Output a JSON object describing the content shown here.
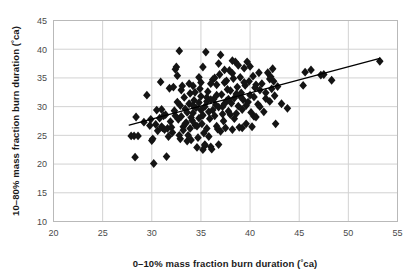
{
  "chart_data": {
    "type": "scatter",
    "title": "",
    "xlabel": "0–10% mass fraction burn duration (°ca)",
    "ylabel": "10–80% mass fraction burn duration (°ca)",
    "xlim": [
      20,
      55
    ],
    "ylim": [
      10,
      45
    ],
    "xticks": [
      20,
      25,
      30,
      35,
      40,
      45,
      50,
      55
    ],
    "yticks": [
      10,
      15,
      20,
      25,
      30,
      35,
      40,
      45
    ],
    "grid": true,
    "legend": null,
    "marker": {
      "shape": "diamond",
      "color": "#141414",
      "size": 4.4
    },
    "trendline": {
      "type": "linear",
      "color": "#000000",
      "width": 1.3,
      "x_start": 27.7,
      "y_start": 26.8,
      "x_end": 53.2,
      "y_end": 38.4
    },
    "points": [
      [
        27.9,
        24.9
      ],
      [
        28.2,
        24.9
      ],
      [
        28.4,
        28.2
      ],
      [
        28.6,
        24.9
      ],
      [
        28.3,
        21.2
      ],
      [
        29.2,
        27.3
      ],
      [
        29.5,
        32.0
      ],
      [
        29.8,
        26.7
      ],
      [
        30.0,
        24.1
      ],
      [
        30.1,
        24.4
      ],
      [
        30.2,
        20.1
      ],
      [
        30.4,
        26.9
      ],
      [
        30.6,
        25.8
      ],
      [
        30.9,
        34.3
      ],
      [
        31.0,
        26.5
      ],
      [
        31.1,
        26.3
      ],
      [
        31.3,
        26.0
      ],
      [
        31.4,
        28.6
      ],
      [
        31.5,
        21.3
      ],
      [
        31.6,
        26.2
      ],
      [
        31.8,
        33.2
      ],
      [
        31.9,
        27.4
      ],
      [
        32.0,
        26.4
      ],
      [
        32.1,
        25.5
      ],
      [
        32.2,
        33.4
      ],
      [
        32.3,
        29.3
      ],
      [
        32.4,
        36.5
      ],
      [
        32.5,
        36.9
      ],
      [
        32.6,
        35.4
      ],
      [
        32.7,
        27.8
      ],
      [
        32.8,
        39.7
      ],
      [
        32.9,
        30.2
      ],
      [
        33.0,
        28.3
      ],
      [
        33.1,
        33.6
      ],
      [
        33.2,
        26.5
      ],
      [
        33.3,
        31.6
      ],
      [
        33.4,
        29.6
      ],
      [
        33.5,
        27.2
      ],
      [
        33.6,
        24.0
      ],
      [
        33.7,
        25.0
      ],
      [
        33.8,
        30.5
      ],
      [
        33.9,
        32.3
      ],
      [
        34.0,
        28.1
      ],
      [
        34.1,
        27.6
      ],
      [
        34.2,
        28.9
      ],
      [
        34.3,
        31.1
      ],
      [
        34.4,
        26.8
      ],
      [
        34.5,
        29.8
      ],
      [
        34.6,
        22.9
      ],
      [
        34.7,
        24.6
      ],
      [
        34.8,
        30.7
      ],
      [
        34.9,
        33.1
      ],
      [
        35.0,
        29.4
      ],
      [
        35.0,
        31.8
      ],
      [
        35.1,
        27.0
      ],
      [
        35.2,
        28.5
      ],
      [
        35.3,
        25.4
      ],
      [
        35.4,
        23.4
      ],
      [
        35.5,
        39.5
      ],
      [
        35.6,
        30.9
      ],
      [
        35.7,
        32.6
      ],
      [
        35.8,
        29.1
      ],
      [
        35.9,
        27.9
      ],
      [
        36.0,
        23.0
      ],
      [
        36.1,
        22.6
      ],
      [
        36.2,
        34.7
      ],
      [
        36.3,
        31.3
      ],
      [
        36.4,
        28.4
      ],
      [
        36.5,
        30.3
      ],
      [
        36.6,
        33.8
      ],
      [
        36.7,
        26.1
      ],
      [
        36.8,
        29.9
      ],
      [
        36.9,
        35.6
      ],
      [
        37.0,
        39.0
      ],
      [
        37.1,
        32.1
      ],
      [
        37.2,
        30.0
      ],
      [
        37.3,
        27.5
      ],
      [
        37.4,
        34.2
      ],
      [
        37.5,
        26.3
      ],
      [
        37.6,
        31.0
      ],
      [
        37.7,
        33.0
      ],
      [
        37.8,
        29.2
      ],
      [
        37.9,
        36.3
      ],
      [
        38.0,
        32.8
      ],
      [
        38.1,
        30.6
      ],
      [
        38.2,
        26.0
      ],
      [
        38.3,
        34.9
      ],
      [
        38.4,
        31.5
      ],
      [
        38.5,
        37.8
      ],
      [
        38.6,
        28.8
      ],
      [
        38.7,
        33.4
      ],
      [
        38.8,
        30.1
      ],
      [
        38.9,
        26.4
      ],
      [
        39.0,
        35.1
      ],
      [
        39.1,
        32.4
      ],
      [
        39.2,
        29.5
      ],
      [
        39.3,
        31.2
      ],
      [
        39.4,
        36.7
      ],
      [
        39.5,
        33.7
      ],
      [
        39.6,
        27.0
      ],
      [
        39.7,
        37.8
      ],
      [
        39.8,
        30.8
      ],
      [
        39.9,
        34.4
      ],
      [
        40.0,
        32.0
      ],
      [
        40.1,
        29.0
      ],
      [
        40.2,
        26.5
      ],
      [
        40.3,
        35.3
      ],
      [
        40.4,
        31.7
      ],
      [
        40.5,
        33.3
      ],
      [
        40.6,
        28.2
      ],
      [
        40.8,
        30.4
      ],
      [
        41.0,
        32.9
      ],
      [
        41.2,
        34.0
      ],
      [
        41.4,
        29.1
      ],
      [
        41.6,
        31.4
      ],
      [
        41.8,
        35.9
      ],
      [
        42.0,
        34.8
      ],
      [
        42.1,
        35.2
      ],
      [
        42.2,
        33.1
      ],
      [
        42.3,
        36.6
      ],
      [
        42.5,
        31.9
      ],
      [
        42.6,
        27.0
      ],
      [
        42.8,
        33.5
      ],
      [
        43.2,
        30.5
      ],
      [
        43.8,
        29.7
      ],
      [
        45.4,
        33.7
      ],
      [
        45.6,
        36.0
      ],
      [
        46.2,
        36.4
      ],
      [
        47.2,
        35.5
      ],
      [
        47.5,
        35.6
      ],
      [
        48.3,
        34.6
      ],
      [
        53.2,
        37.9
      ],
      [
        34.6,
        26.6
      ],
      [
        35.2,
        22.5
      ],
      [
        35.4,
        23.2
      ],
      [
        33.2,
        25.9
      ],
      [
        32.6,
        30.8
      ],
      [
        36.0,
        34.0
      ],
      [
        36.4,
        35.0
      ],
      [
        37.4,
        36.4
      ],
      [
        38.2,
        35.8
      ],
      [
        38.6,
        32.2
      ],
      [
        34.2,
        33.6
      ],
      [
        33.8,
        34.0
      ],
      [
        35.6,
        26.2
      ],
      [
        36.6,
        26.6
      ],
      [
        37.0,
        25.7
      ],
      [
        36.8,
        23.4
      ],
      [
        35.8,
        24.8
      ],
      [
        34.4,
        32.5
      ],
      [
        33.0,
        32.9
      ],
      [
        32.4,
        28.4
      ],
      [
        31.2,
        28.4
      ],
      [
        30.8,
        28.0
      ],
      [
        29.9,
        27.8
      ],
      [
        39.2,
        26.3
      ],
      [
        40.0,
        37.0
      ],
      [
        38.8,
        37.2
      ],
      [
        37.6,
        34.5
      ],
      [
        36.2,
        29.4
      ],
      [
        35.0,
        34.2
      ],
      [
        34.8,
        35.1
      ],
      [
        37.2,
        28.7
      ],
      [
        38.4,
        27.9
      ],
      [
        39.6,
        30.2
      ],
      [
        41.0,
        30.0
      ],
      [
        42.0,
        30.9
      ],
      [
        33.4,
        27.0
      ],
      [
        32.8,
        25.0
      ],
      [
        31.7,
        24.8
      ],
      [
        34.0,
        24.2
      ],
      [
        35.6,
        31.6
      ],
      [
        36.6,
        32.0
      ],
      [
        37.8,
        31.3
      ],
      [
        39.0,
        31.8
      ],
      [
        40.4,
        28.3
      ],
      [
        33.6,
        29.0
      ],
      [
        34.2,
        30.2
      ],
      [
        35.4,
        30.0
      ],
      [
        36.0,
        31.2
      ],
      [
        37.4,
        30.5
      ],
      [
        38.0,
        28.6
      ],
      [
        39.4,
        34.2
      ],
      [
        40.6,
        33.8
      ],
      [
        35.2,
        36.9
      ],
      [
        36.8,
        37.5
      ],
      [
        38.2,
        38.0
      ],
      [
        34.8,
        28.0
      ],
      [
        33.9,
        26.2
      ],
      [
        32.9,
        24.4
      ],
      [
        31.0,
        29.5
      ],
      [
        30.5,
        29.4
      ],
      [
        41.6,
        32.4
      ],
      [
        42.4,
        34.4
      ],
      [
        40.9,
        35.9
      ]
    ]
  }
}
